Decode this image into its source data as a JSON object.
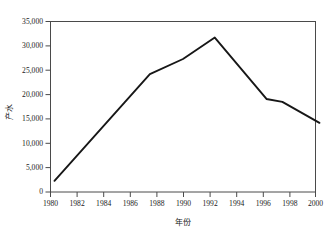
{
  "chart_data": {
    "type": "line",
    "title": "",
    "xlabel": "年份",
    "ylabel": "产水",
    "xlim": [
      1980,
      2000
    ],
    "ylim": [
      0,
      35000
    ],
    "grid": false,
    "legend": false,
    "legend_position": "none",
    "xticks": [
      "1980",
      "1982",
      "1984",
      "1986",
      "1988",
      "1990",
      "1992",
      "1994",
      "1996",
      "1998",
      "2000"
    ],
    "xtick_values": [
      1980,
      1982,
      1984,
      1986,
      1988,
      1990,
      1992,
      1994,
      1996,
      1998,
      2000
    ],
    "yticks": [
      "0",
      "5,000",
      "10,000",
      "15,000",
      "20,000",
      "25,000",
      "30,000",
      "35,000"
    ],
    "ytick_values": [
      0,
      5000,
      10000,
      15000,
      20000,
      25000,
      30000,
      35000
    ],
    "series": [
      {
        "name": "产水",
        "color": "#171717",
        "x": [
          1980.3,
          1987.5,
          1990.0,
          1992.4,
          1996.3,
          1997.5,
          2000.3
        ],
        "values": [
          2300,
          24200,
          27300,
          31700,
          19100,
          18500,
          14200
        ]
      }
    ]
  },
  "axes": {
    "y_title": "产水",
    "x_title": "年份"
  }
}
